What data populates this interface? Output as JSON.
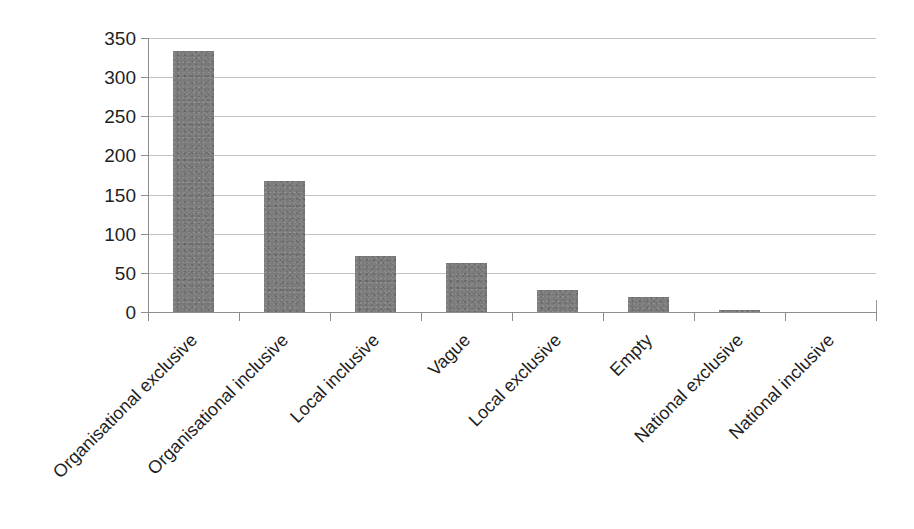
{
  "chart_data": {
    "type": "bar",
    "title": "",
    "subtitle": "",
    "xlabel": "",
    "ylabel": "",
    "categories": [
      "Organisational exclusive",
      "Organisational inclusive",
      "Local inclusive",
      "Vague",
      "Local exclusive",
      "Empty",
      "National exclusive",
      "National inclusive"
    ],
    "values": [
      333,
      167,
      71,
      63,
      28,
      19,
      3,
      0
    ],
    "ylim": [
      0,
      350
    ],
    "yticks": [
      0,
      50,
      100,
      150,
      200,
      250,
      300,
      350
    ],
    "ytick_labels": [
      "0",
      "50",
      "100",
      "150",
      "200",
      "250",
      "300",
      "350"
    ],
    "grid": true,
    "legend": false,
    "legend_position": "none",
    "series": [
      {
        "name": "Count",
        "values": [
          333,
          167,
          71,
          63,
          28,
          19,
          3,
          0
        ],
        "color": "#7b7b7b"
      }
    ],
    "colors": {
      "bar": "#7b7b7b",
      "gridline": "#b9b9b9",
      "axis": "#8e8e8e",
      "text": "#1f1f1f",
      "background": "#ffffff"
    },
    "annotations": []
  }
}
